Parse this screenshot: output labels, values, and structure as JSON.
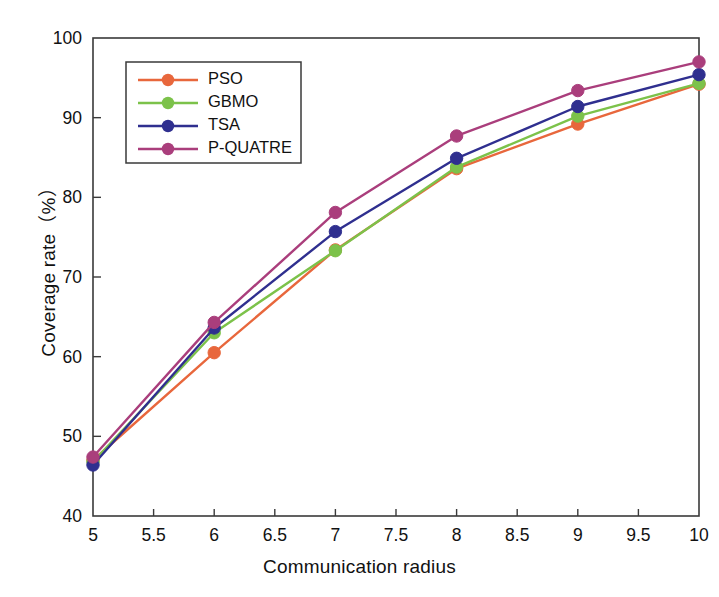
{
  "chart_data": {
    "type": "line",
    "title": "",
    "xlabel": "Communication radius",
    "ylabel": "Coverage rate（%）",
    "xlim": [
      5,
      10
    ],
    "ylim": [
      40,
      100
    ],
    "xticks": [
      "5",
      "5.5",
      "6",
      "6.5",
      "7",
      "7.5",
      "8",
      "8.5",
      "9",
      "9.5",
      "10"
    ],
    "xtick_values": [
      5,
      5.5,
      6,
      6.5,
      7,
      7.5,
      8,
      8.5,
      9,
      9.5,
      10
    ],
    "yticks": [
      "40",
      "50",
      "60",
      "70",
      "80",
      "90",
      "100"
    ],
    "ytick_values": [
      40,
      50,
      60,
      70,
      80,
      90,
      100
    ],
    "grid": false,
    "legend_position": "upper-left",
    "marker": "circle",
    "x": [
      5,
      6,
      7,
      8,
      9,
      10
    ],
    "series": [
      {
        "name": "PSO",
        "color": "#E8673C",
        "values": [
          47.0,
          60.5,
          73.4,
          83.6,
          89.2,
          94.2
        ]
      },
      {
        "name": "GBMO",
        "color": "#7CC24A",
        "values": [
          46.8,
          63.0,
          73.3,
          83.8,
          90.2,
          94.3
        ]
      },
      {
        "name": "TSA",
        "color": "#2F2F8F",
        "values": [
          46.4,
          63.6,
          75.7,
          84.9,
          91.4,
          95.4
        ]
      },
      {
        "name": "P-QUATRE",
        "color": "#AA3E7C",
        "values": [
          47.4,
          64.3,
          78.1,
          87.7,
          93.4,
          97.0
        ]
      }
    ]
  },
  "legend": {
    "entries": [
      {
        "label": "PSO"
      },
      {
        "label": "GBMO"
      },
      {
        "label": "TSA"
      },
      {
        "label": "P-QUATRE"
      }
    ]
  }
}
